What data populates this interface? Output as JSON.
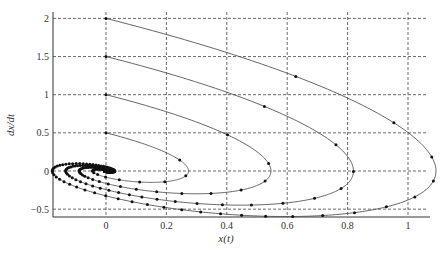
{
  "chart_data": {
    "type": "line",
    "title": "",
    "xlabel": "x(t)",
    "ylabel": "dx/dt",
    "xlim": [
      -0.175,
      1.075
    ],
    "ylim": [
      -0.62,
      2.0
    ],
    "grid": true,
    "grid_style": "dashed",
    "legend": null,
    "xticks": [
      0,
      0.2,
      0.4,
      0.6,
      0.8,
      1
    ],
    "xtick_labels": [
      "0",
      "0.2",
      "0.4",
      "0.6",
      "0.8",
      "1"
    ],
    "yticks": [
      -0.5,
      0,
      0.5,
      1,
      1.5,
      2
    ],
    "ytick_labels": [
      "−0.5",
      "0",
      "0.5",
      "1",
      "1.5",
      "2"
    ],
    "model": {
      "omega": 1.0,
      "zeta": 0.5,
      "x0": 0,
      "t_end": 14
    },
    "series": [
      {
        "name": "dx/dt(0)=0.5",
        "v0": 0.5,
        "x_max": 0.27,
        "v_min": -0.15
      },
      {
        "name": "dx/dt(0)=1.0",
        "v0": 1.0,
        "x_max": 0.54,
        "v_min": -0.3
      },
      {
        "name": "dx/dt(0)=1.5",
        "v0": 1.5,
        "x_max": 0.8,
        "v_min": -0.45
      },
      {
        "name": "dx/dt(0)=2.0",
        "v0": 2.0,
        "x_max": 1.07,
        "v_min": -0.6
      }
    ],
    "line_color": "#555555",
    "marker_color": "#111111"
  },
  "layout": {
    "plot_left": 53,
    "plot_right": 430,
    "plot_top": 12,
    "plot_bottom": 217,
    "x0_px": 106,
    "x_scale": 302,
    "y0_px": 171,
    "y_scale": 76.3
  }
}
